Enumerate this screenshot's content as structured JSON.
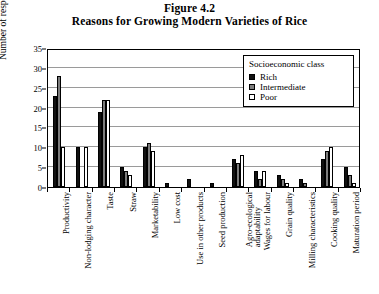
{
  "figure": {
    "number": "Figure 4.2",
    "title": "Reasons for Growing Modern Varieties of Rice"
  },
  "legend": {
    "title": "Socioeconomic class",
    "entries": [
      {
        "label": "Rich",
        "color": "#111111"
      },
      {
        "label": "Intermediate",
        "color": "#7d7d7d"
      },
      {
        "label": "Poor",
        "color": "#ffffff"
      }
    ]
  },
  "axes": {
    "ylabel": "Number of respondents",
    "yticks": [
      "0",
      "5",
      "10",
      "15",
      "20",
      "25",
      "30",
      "35"
    ],
    "xlabel": ""
  },
  "chart_data": {
    "type": "bar",
    "title": "Reasons for Growing Modern Varieties of Rice",
    "subtitle": "Figure 4.2",
    "xlabel": "",
    "ylabel": "Number of respondents",
    "ylim": [
      0,
      35
    ],
    "ytick_step": 5,
    "grid": true,
    "legend_position": "top-right",
    "legend_title": "Socioeconomic class",
    "categories": [
      "Productivity",
      "Non-lodging character",
      "Taste",
      "Straw",
      "Marketability",
      "Low cost",
      "Use in other products",
      "Seed production",
      "Agro-ecological adaptability",
      "Wages for labour",
      "Grain quality",
      "Milling characteristics",
      "Cooking quality",
      "Maturation period"
    ],
    "series": [
      {
        "name": "Rich",
        "color": "#111111",
        "values": [
          23,
          10,
          19,
          5,
          10,
          1,
          2,
          1,
          7,
          4,
          3,
          2,
          7,
          5
        ]
      },
      {
        "name": "Intermediate",
        "color": "#7d7d7d",
        "values": [
          28,
          0,
          22,
          4,
          11,
          0,
          0,
          0,
          6,
          2,
          2,
          1,
          9,
          3
        ]
      },
      {
        "name": "Poor",
        "color": "#ffffff",
        "values": [
          10,
          10,
          22,
          3,
          9,
          0,
          0,
          0,
          8,
          4,
          1,
          0,
          10,
          1
        ]
      }
    ]
  }
}
